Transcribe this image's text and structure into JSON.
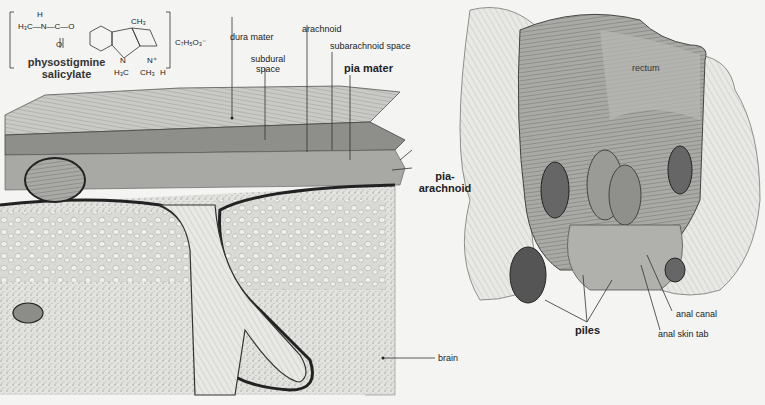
{
  "chemical": {
    "name_line1": "physostigmine",
    "name_line2": "salicylate",
    "formula_left": "H₃C—N—C—O",
    "h_atom": "H",
    "o_atom": "O",
    "ch3_top": "CH₃",
    "n_ring": "N",
    "n_plus": "N⁺",
    "h3c_bottom": "H₃C",
    "ch3_bottom": "CH₃",
    "h_bottom": "H",
    "counter_ion": "C₇H₅O₃⁻"
  },
  "meninges_figure": {
    "labels": {
      "dura_mater": "dura mater",
      "arachnoid": "arachnoid",
      "subdural_line1": "subdural",
      "subdural_line2": "space",
      "subarachnoid_space": "subarachnoid space",
      "pia_mater": "pia mater",
      "pia_arachnoid_line1": "pia-",
      "pia_arachnoid_line2": "arachnoid",
      "brain": "brain"
    }
  },
  "rectum_figure": {
    "labels": {
      "rectum": "rectum",
      "piles": "piles",
      "anal_canal": "anal canal",
      "anal_skin_tab": "anal skin tab"
    }
  }
}
